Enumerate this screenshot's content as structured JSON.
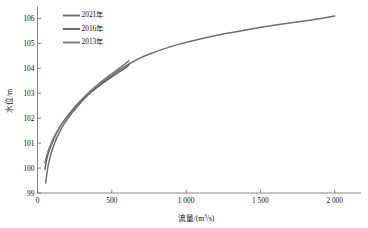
{
  "chart_data": {
    "type": "line",
    "title": "",
    "xlabel": "流量/(m³/s)",
    "ylabel": "水位/m",
    "xlim": [
      0,
      2150
    ],
    "ylim": [
      99,
      106.4
    ],
    "xticks": [
      0,
      500,
      1000,
      1500,
      2000
    ],
    "xtick_labels": [
      "0",
      "500",
      "1 000",
      "1 500",
      "2 000"
    ],
    "yticks": [
      99,
      100,
      101,
      102,
      103,
      104,
      105,
      106
    ],
    "ytick_labels": [
      "99",
      "100",
      "101",
      "102",
      "103",
      "104",
      "105",
      "106"
    ],
    "grid": false,
    "legend_position": "upper-left",
    "series": [
      {
        "name": "2021年",
        "color": "#6f6f6f",
        "points": [
          [
            55,
            99.4
          ],
          [
            70,
            100.05
          ],
          [
            90,
            100.55
          ],
          [
            115,
            101.0
          ],
          [
            145,
            101.4
          ],
          [
            180,
            101.78
          ],
          [
            220,
            102.12
          ],
          [
            265,
            102.45
          ],
          [
            315,
            102.78
          ],
          [
            370,
            103.1
          ],
          [
            430,
            103.4
          ],
          [
            495,
            103.7
          ],
          [
            560,
            103.97
          ],
          [
            630,
            104.22
          ],
          [
            700,
            104.44
          ],
          [
            780,
            104.63
          ],
          [
            870,
            104.82
          ],
          [
            960,
            104.98
          ],
          [
            1060,
            105.13
          ],
          [
            1170,
            105.28
          ],
          [
            1290,
            105.42
          ],
          [
            1420,
            105.56
          ],
          [
            1560,
            105.7
          ],
          [
            1710,
            105.83
          ],
          [
            1860,
            105.96
          ],
          [
            2000,
            106.1
          ]
        ]
      },
      {
        "name": "2016年",
        "color": "#626262",
        "points": [
          [
            50,
            99.95
          ],
          [
            62,
            100.35
          ],
          [
            80,
            100.72
          ],
          [
            105,
            101.1
          ],
          [
            135,
            101.48
          ],
          [
            170,
            101.82
          ],
          [
            210,
            102.14
          ],
          [
            255,
            102.45
          ],
          [
            305,
            102.76
          ],
          [
            360,
            103.05
          ],
          [
            420,
            103.33
          ],
          [
            480,
            103.58
          ],
          [
            540,
            103.82
          ],
          [
            600,
            104.05
          ],
          [
            620,
            104.2
          ]
        ]
      },
      {
        "name": "2013年",
        "color": "#7a7a7a",
        "points": [
          [
            50,
            100.2
          ],
          [
            62,
            100.5
          ],
          [
            80,
            100.82
          ],
          [
            105,
            101.16
          ],
          [
            135,
            101.5
          ],
          [
            170,
            101.83
          ],
          [
            210,
            102.15
          ],
          [
            255,
            102.48
          ],
          [
            305,
            102.8
          ],
          [
            360,
            103.12
          ],
          [
            420,
            103.42
          ],
          [
            480,
            103.7
          ],
          [
            540,
            103.96
          ],
          [
            590,
            104.18
          ],
          [
            615,
            104.3
          ]
        ]
      }
    ]
  },
  "legend": {
    "items": [
      {
        "label": "2021年",
        "color": "#6f6f6f"
      },
      {
        "label": "2016年",
        "color": "#626262"
      },
      {
        "label": "2013年",
        "color": "#7a7a7a"
      }
    ]
  }
}
